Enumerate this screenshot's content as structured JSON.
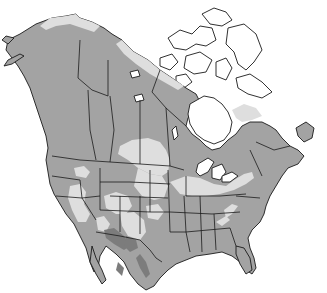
{
  "map": {
    "title": "North America range map",
    "region": "North America",
    "legend_implied": [
      {
        "name": "range-primary",
        "color": "#a3a3a3"
      },
      {
        "name": "range-light",
        "color": "#dedede"
      },
      {
        "name": "range-dark",
        "color": "#7c7c7c"
      },
      {
        "name": "outside-range",
        "color": "#ffffff"
      }
    ],
    "colors": {
      "background": "#ffffff",
      "border": "#1a1a1a",
      "water": "#ffffff"
    }
  }
}
